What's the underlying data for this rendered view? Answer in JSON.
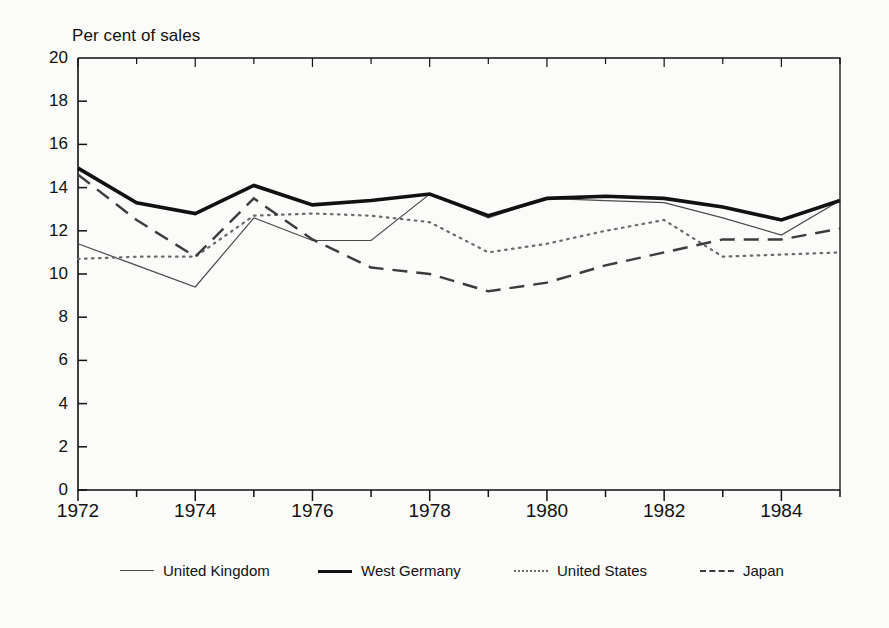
{
  "figure": {
    "axis_title": "Per cent of sales",
    "background_color": "#fbfbfa",
    "ink_color": "#111111"
  },
  "legend": [
    {
      "key": "uk",
      "label": "United Kingdom",
      "style": "solid-thin",
      "color": "#4a4a4a",
      "x": 120
    },
    {
      "key": "wg",
      "label": "West Germany",
      "style": "solid-thick",
      "color": "#111111",
      "x": 318
    },
    {
      "key": "us",
      "label": "United States",
      "style": "dotted",
      "color": "#6a6a6a",
      "x": 514
    },
    {
      "key": "jp",
      "label": "Japan",
      "style": "dashed",
      "color": "#3c3c3c",
      "x": 700
    }
  ],
  "chart_data": {
    "type": "line",
    "title": "",
    "xlabel": "",
    "ylabel": "Per cent of sales",
    "xlim": [
      1972,
      1985
    ],
    "ylim": [
      0,
      20
    ],
    "ytick_step": 2,
    "yticks": [
      0,
      2,
      4,
      6,
      8,
      10,
      12,
      14,
      16,
      18,
      20
    ],
    "xticks": [
      1972,
      1973,
      1974,
      1975,
      1976,
      1977,
      1978,
      1979,
      1980,
      1981,
      1982,
      1983,
      1984,
      1985
    ],
    "xtick_labels": [
      "1972",
      "1974",
      "1976",
      "1978",
      "1980",
      "1982",
      "1984"
    ],
    "xtick_labels_years": [
      1972,
      1974,
      1976,
      1978,
      1980,
      1982,
      1984
    ],
    "grid": false,
    "legend_position": "bottom",
    "x": [
      1972,
      1973,
      1974,
      1975,
      1976,
      1977,
      1978,
      1979,
      1980,
      1981,
      1982,
      1983,
      1984,
      1985
    ],
    "series": [
      {
        "name": "United Kingdom",
        "style": "solid-thin",
        "color": "#4a4a4a",
        "width": 1.2,
        "values": [
          11.4,
          10.4,
          9.4,
          12.6,
          11.55,
          11.55,
          13.7,
          12.6,
          13.5,
          13.4,
          13.3,
          12.6,
          11.8,
          13.4
        ]
      },
      {
        "name": "West Germany",
        "style": "solid-thick",
        "color": "#111111",
        "width": 3.6,
        "values": [
          14.9,
          13.3,
          12.8,
          14.1,
          13.2,
          13.4,
          13.7,
          12.7,
          13.5,
          13.6,
          13.5,
          13.1,
          12.5,
          13.4
        ]
      },
      {
        "name": "United States",
        "style": "dotted",
        "color": "#6a6a6a",
        "width": 2.2,
        "values": [
          10.7,
          10.8,
          10.8,
          12.7,
          12.8,
          12.7,
          12.4,
          11.0,
          11.4,
          12.0,
          12.5,
          10.8,
          10.9,
          11.0
        ]
      },
      {
        "name": "Japan",
        "style": "dashed",
        "color": "#3c3c3c",
        "width": 2.4,
        "values": [
          14.6,
          12.5,
          10.8,
          13.5,
          11.6,
          10.3,
          10.0,
          9.2,
          9.6,
          10.4,
          11.0,
          11.6,
          11.6,
          12.1
        ]
      }
    ]
  }
}
